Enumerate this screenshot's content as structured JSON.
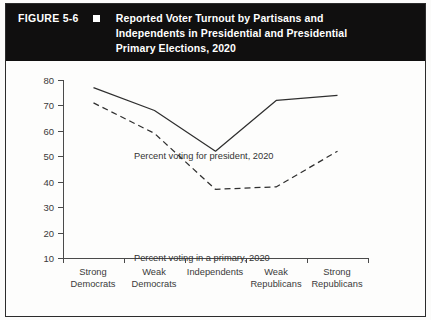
{
  "figure": {
    "number": "FIGURE 5-6",
    "marker_icon": "square-bullet-icon",
    "title_lines": [
      "Reported Voter Turnout by Partisans and",
      "Independents in Presidential and Presidential",
      "Primary Elections, 2020"
    ]
  },
  "chart_data": {
    "type": "line",
    "title": "Reported Voter Turnout by Partisans and Independents in Presidential and Presidential Primary Elections, 2020",
    "xlabel": "",
    "ylabel": "",
    "categories": [
      "Strong Democrats",
      "Weak Democrats",
      "Independents",
      "Weak Republicans",
      "Strong Republicans"
    ],
    "category_lines": [
      [
        "Strong",
        "Democrats"
      ],
      [
        "Weak",
        "Democrats"
      ],
      [
        "Independents",
        ""
      ],
      [
        "Weak",
        "Republicans"
      ],
      [
        "Strong",
        "Republicans"
      ]
    ],
    "series": [
      {
        "name": "Percent voting for president, 2020",
        "style": "solid",
        "color": "#2f2f2f",
        "values": [
          77,
          68,
          52,
          72,
          74
        ]
      },
      {
        "name": "Percent voting in a primary, 2020",
        "style": "dashed",
        "color": "#2f2f2f",
        "values": [
          71,
          59,
          37,
          38,
          52
        ]
      }
    ],
    "ylim": [
      10,
      80
    ],
    "yticks": [
      80,
      70,
      60,
      50,
      40,
      30,
      20,
      10
    ],
    "ytick_labels": [
      "80",
      "70",
      "60",
      "50",
      "40",
      "30",
      "20",
      "10"
    ],
    "grid": false,
    "legend_position": "inline-annotations",
    "annotations": [
      "Percent voting for president, 2020",
      "Percent voting in a primary, 2020"
    ]
  },
  "colors": {
    "header_background": "#100f0f",
    "header_text": "#ffffff",
    "axis": "#4a4a4a",
    "line": "#2f2f2f",
    "page_background": "#fdfdfc",
    "border": "#2b2b2b"
  }
}
